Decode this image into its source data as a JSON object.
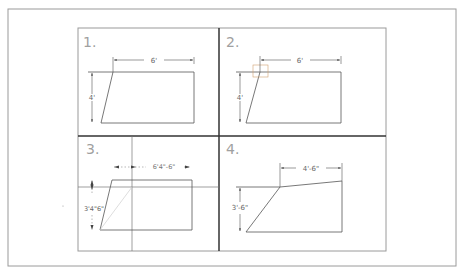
{
  "colors": {
    "background": "#ffffff",
    "frame": "#9a9a9a",
    "line": "#555555",
    "divider": "#333333",
    "faint": "#bdbdbd",
    "text": "#666666",
    "number": "#a0a0a0"
  },
  "panels": [
    {
      "number": "1.",
      "top_dim": "6'",
      "side_dim": "4'"
    },
    {
      "number": "2.",
      "top_dim": "6'",
      "side_dim": "4'"
    },
    {
      "number": "3.",
      "top_dim": "6'4\"-6\"",
      "side_dim": "3'4\"6\""
    },
    {
      "number": "4.",
      "top_dim": "4'-6\"",
      "side_dim": "3'-6\""
    }
  ]
}
